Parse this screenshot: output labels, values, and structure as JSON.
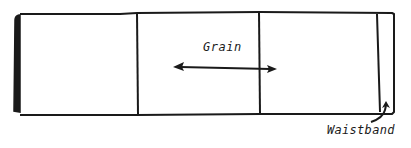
{
  "diagram": {
    "type": "pattern-layout",
    "colors": {
      "ink": "#1a1a1a",
      "paper": "#ffffff"
    },
    "panel": {
      "sections": 4,
      "left_edge": "thick selvage edge"
    },
    "labels": {
      "grain": "Grain",
      "waistband": "Waistband"
    },
    "arrows": [
      {
        "name": "grain-arrow",
        "direction": "bidirectional-horizontal"
      },
      {
        "name": "waistband-pointer-arrow",
        "direction": "up"
      }
    ]
  }
}
